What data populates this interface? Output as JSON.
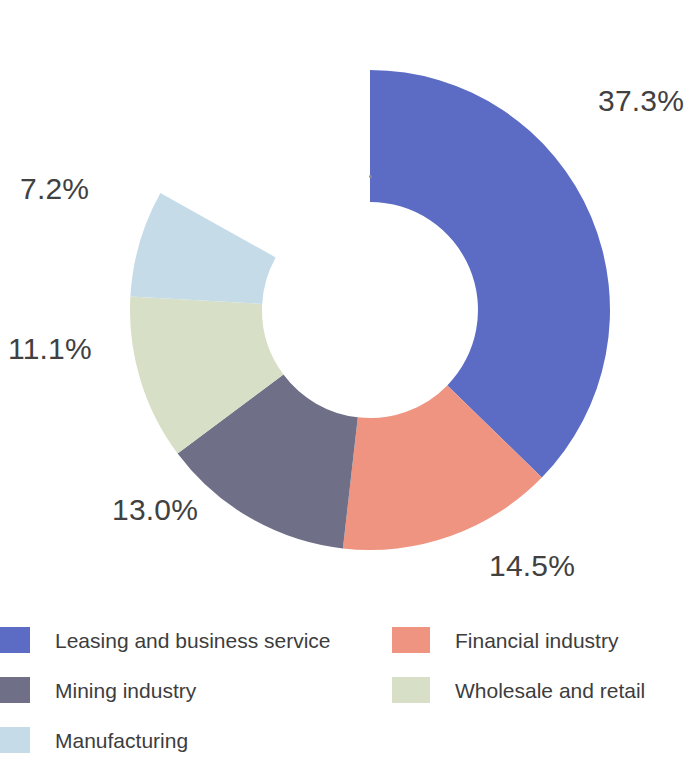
{
  "chart_data": {
    "type": "pie",
    "variant": "donut",
    "title": "",
    "subtitle": "",
    "xlabel": "",
    "ylabel": "",
    "grid": false,
    "legend_position": "bottom",
    "units": "percent",
    "value_suffix": "%",
    "start_angle_deg": 0,
    "direction": "clockwise",
    "center": {
      "x": 370,
      "y": 310
    },
    "outer_radius": 240,
    "inner_radius": 108,
    "total_shown": 83.1,
    "unlabeled_gap_percent": 16.9,
    "categories": [
      "Leasing and business service",
      "Financial industry",
      "Mining industry",
      "Wholesale and retail",
      "Manufacturing"
    ],
    "values": [
      37.3,
      14.5,
      13.0,
      11.1,
      7.2
    ],
    "labels": [
      "37.3%",
      "14.5%",
      "13.0%",
      "11.1%",
      "7.2%"
    ],
    "colors": [
      "#5C6CC4",
      "#EF9480",
      "#6F7088",
      "#D7DFC6",
      "#C5DCE8"
    ],
    "slices": [
      {
        "name": "Leasing and business service",
        "value": 37.3,
        "label": "37.3%",
        "color": "#5C6CC4",
        "start_deg": 0,
        "end_deg": 134.28,
        "label_pos": {
          "x": 598,
          "y": 86
        }
      },
      {
        "name": "Financial industry",
        "value": 14.5,
        "label": "14.5%",
        "color": "#EF9480",
        "start_deg": 134.28,
        "end_deg": 186.48,
        "label_pos": {
          "x": 489,
          "y": 551
        }
      },
      {
        "name": "Mining industry",
        "value": 13.0,
        "label": "13.0%",
        "color": "#6F7088",
        "start_deg": 186.48,
        "end_deg": 233.28,
        "label_pos": {
          "x": 112,
          "y": 495
        }
      },
      {
        "name": "Wholesale and retail",
        "value": 11.1,
        "label": "11.1%",
        "color": "#D7DFC6",
        "start_deg": 233.28,
        "end_deg": 273.24,
        "label_pos": {
          "x": 8,
          "y": 334
        }
      },
      {
        "name": "Manufacturing",
        "value": 7.2,
        "label": "7.2%",
        "color": "#C5DCE8",
        "start_deg": 273.24,
        "end_deg": 299.16,
        "label_pos": {
          "x": 20,
          "y": 174
        }
      }
    ]
  },
  "labels": {
    "pct_0": "37.3%",
    "pct_1": "14.5%",
    "pct_2": "13.0%",
    "pct_3": "11.1%",
    "pct_4": "7.2%"
  },
  "legend": {
    "items": [
      {
        "label": "Leasing and business service",
        "color": "#5C6CC4"
      },
      {
        "label": "Financial industry",
        "color": "#EF9480"
      },
      {
        "label": "Mining industry",
        "color": "#6F7088"
      },
      {
        "label": "Wholesale and retail",
        "color": "#D7DFC6"
      },
      {
        "label": "Manufacturing",
        "color": "#C5DCE8"
      }
    ]
  },
  "theme": {
    "background": "#FFFFFF",
    "text_color": "#3F3F3F",
    "accent": "#5C6CC4"
  }
}
